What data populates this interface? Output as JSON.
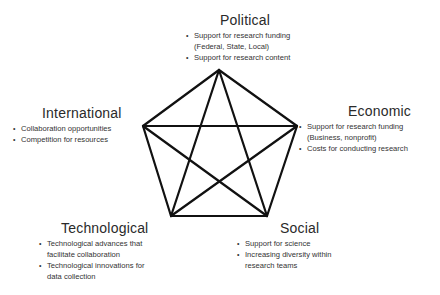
{
  "diagram": {
    "type": "pentagram-network",
    "nodes": [
      {
        "id": "political",
        "title": "Political",
        "bullets": [
          "Support for research funding",
          "(Federal, State, Local)",
          "Support for research content"
        ],
        "bullet_flags": [
          true,
          false,
          true
        ],
        "vertex": [
          219,
          70
        ]
      },
      {
        "id": "international",
        "title": "International",
        "bullets": [
          "Collaboration opportunities",
          "Competition for resources"
        ],
        "bullet_flags": [
          true,
          true
        ],
        "vertex": [
          143,
          126
        ]
      },
      {
        "id": "economic",
        "title": "Economic",
        "bullets": [
          "Support for research funding",
          "(Business, nonprofit)",
          "Costs for conducting research"
        ],
        "bullet_flags": [
          true,
          false,
          true
        ],
        "vertex": [
          297,
          126
        ]
      },
      {
        "id": "technological",
        "title": "Technological",
        "bullets": [
          "Technological advances that",
          "facilitate collaboration",
          "Technological innovations for",
          "data collection"
        ],
        "bullet_flags": [
          true,
          false,
          true,
          false
        ],
        "vertex": [
          171,
          216
        ]
      },
      {
        "id": "social",
        "title": "Social",
        "bullets": [
          "Support for science",
          "Increasing diversity within",
          "research teams"
        ],
        "bullet_flags": [
          true,
          true,
          false
        ],
        "vertex": [
          267,
          216
        ]
      }
    ],
    "edges": [
      [
        "political",
        "international"
      ],
      [
        "political",
        "economic"
      ],
      [
        "political",
        "technological"
      ],
      [
        "political",
        "social"
      ],
      [
        "international",
        "economic"
      ],
      [
        "international",
        "technological"
      ],
      [
        "international",
        "social"
      ],
      [
        "economic",
        "technological"
      ],
      [
        "economic",
        "social"
      ],
      [
        "technological",
        "social"
      ]
    ],
    "line_color": "#111111",
    "bullet_glyph": "•"
  }
}
